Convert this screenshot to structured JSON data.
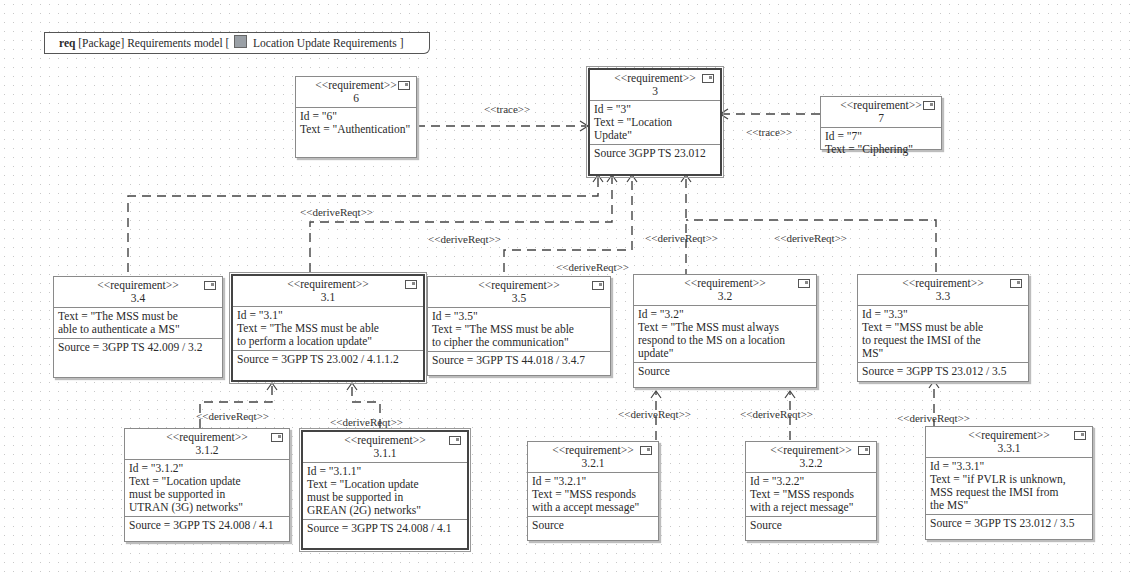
{
  "frame": {
    "kind": "req",
    "label_pre": "[Package] Requirements model [",
    "label_name": "Location Update Requirements",
    "label_post": "]",
    "icon": "package-diagram-icon"
  },
  "requirements": {
    "r6": {
      "stereotype": "<<requirement>>",
      "name": "6",
      "lines": [
        "Id = \"6\"",
        "Text = \"Authentication\""
      ],
      "source": ""
    },
    "r3": {
      "stereotype": "<<requirement>>",
      "name": "3",
      "lines": [
        "Id = \"3\"",
        "Text = \"Location",
        "Update\""
      ],
      "source": "Source 3GPP TS 23.012"
    },
    "r7": {
      "stereotype": "<<requirement>>",
      "name": "7",
      "lines": [
        "Id = \"7\"",
        "Text = \"Ciphering\""
      ],
      "source": ""
    },
    "r34": {
      "stereotype": "<<requirement>>",
      "name": "3.4",
      "lines": [
        "Text = \"The MSS must be",
        "able to authenticate a MS\""
      ],
      "source": "Source = 3GPP TS 42.009 / 3.2"
    },
    "r31": {
      "stereotype": "<<requirement>>",
      "name": "3.1",
      "lines": [
        "Id = \"3.1\"",
        "Text = \"The MSS must be able",
        "to perform a location update\""
      ],
      "source": "Source = 3GPP TS 23.002 / 4.1.1.2"
    },
    "r35": {
      "stereotype": "<<requirement>>",
      "name": "3.5",
      "lines": [
        "Id = \"3.5\"",
        "Text = \"The MSS must be able",
        "to cipher the communication\""
      ],
      "source": "Source = 3GPP TS 44.018 / 3.4.7"
    },
    "r32": {
      "stereotype": "<<requirement>>",
      "name": "3.2",
      "lines": [
        "Id = \"3.2\"",
        "Text = \"The MSS must always",
        "respond to the MS on a location",
        "update\""
      ],
      "source": "Source"
    },
    "r33": {
      "stereotype": "<<requirement>>",
      "name": "3.3",
      "lines": [
        "Id = \"3.3\"",
        "Text = \"MSS must be able",
        "to request the IMSI of the",
        "MS\""
      ],
      "source": "Source = 3GPP TS 23.012 / 3.5"
    },
    "r312": {
      "stereotype": "<<requirement>>",
      "name": "3.1.2",
      "lines": [
        "Id = \"3.1.2\"",
        "Text = \"Location update",
        "must be supported in",
        "UTRAN (3G) networks\""
      ],
      "source": "Source = 3GPP TS 24.008 / 4.1"
    },
    "r311": {
      "stereotype": "<<requirement>>",
      "name": "3.1.1",
      "lines": [
        "Id = \"3.1.1\"",
        "Text = \"Location update",
        "must be supported in",
        "GREAN (2G) networks\""
      ],
      "source": "Source = 3GPP TS 24.008 / 4.1"
    },
    "r321": {
      "stereotype": "<<requirement>>",
      "name": "3.2.1",
      "lines": [
        "Id = \"3.2.1\"",
        "Text = \"MSS responds",
        "with a accept message\""
      ],
      "source": "Source"
    },
    "r322": {
      "stereotype": "<<requirement>>",
      "name": "3.2.2",
      "lines": [
        "Id = \"3.2.2\"",
        "Text = \"MSS responds",
        "with a reject message\""
      ],
      "source": "Source"
    },
    "r331": {
      "stereotype": "<<requirement>>",
      "name": "3.3.1",
      "lines": [
        "Id = \"3.3.1\"",
        "Text = \"if PVLR is unknown,",
        "MSS request the IMSI from",
        "the MS\""
      ],
      "source": "Source = 3GPP TS 23.012 / 3.5"
    }
  },
  "relations": {
    "trace_6_3": "<<trace>>",
    "trace_7_3": "<<trace>>",
    "derive_31": "<<deriveReqt>>",
    "derive_35": "<<deriveReqt>>",
    "derive_34": "<<deriveReqt>>",
    "derive_32": "<<deriveReqt>>",
    "derive_33": "<<deriveReqt>>",
    "derive_312": "<<deriveReqt>>",
    "derive_311": "<<deriveReqt>>",
    "derive_321": "<<deriveReqt>>",
    "derive_322": "<<deriveReqt>>",
    "derive_331": "<<deriveReqt>>"
  }
}
